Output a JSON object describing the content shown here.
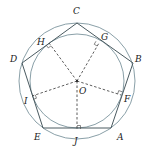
{
  "diagram": {
    "type": "geometry",
    "center": {
      "label": "O",
      "x": 77,
      "y": 81
    },
    "circumcircle_radius": 58,
    "incircle_radius": 47,
    "colors": {
      "circle": "#8aa0a8",
      "polygon": "#4a5a60",
      "dashed": "#333333",
      "label": "#222222"
    },
    "vertices": [
      {
        "label": "A",
        "x": 111,
        "y": 128,
        "lx": 117,
        "ly": 140
      },
      {
        "label": "B",
        "x": 133,
        "y": 63,
        "lx": 135,
        "ly": 62
      },
      {
        "label": "C",
        "x": 77,
        "y": 23,
        "lx": 73,
        "ly": 14
      },
      {
        "label": "D",
        "x": 22,
        "y": 63,
        "lx": 10,
        "ly": 62
      },
      {
        "label": "E",
        "x": 43,
        "y": 128,
        "lx": 34,
        "ly": 140
      }
    ],
    "tangent_points": [
      {
        "label": "F",
        "x": 121,
        "y": 95,
        "lx": 124,
        "ly": 102
      },
      {
        "label": "G",
        "x": 99,
        "y": 43,
        "lx": 101,
        "ly": 40
      },
      {
        "label": "H",
        "x": 49,
        "y": 43,
        "lx": 37,
        "ly": 45
      },
      {
        "label": "I",
        "x": 32,
        "y": 96,
        "lx": 24,
        "ly": 104
      },
      {
        "label": "J",
        "x": 77,
        "y": 129,
        "lx": 74,
        "ly": 144
      }
    ],
    "center_label": {
      "text": "O",
      "lx": 79,
      "ly": 94
    }
  }
}
